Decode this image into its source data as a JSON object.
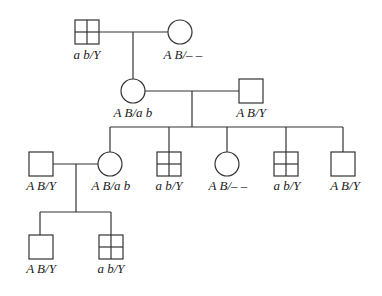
{
  "generations": {
    "I": {
      "father": {
        "sex": "male",
        "affected": true,
        "genotype": "a b/Y"
      },
      "mother": {
        "sex": "female",
        "affected": false,
        "genotype": "A B/– –"
      }
    },
    "II": {
      "daughter": {
        "sex": "female",
        "affected": false,
        "genotype": "A B/a b"
      },
      "spouse": {
        "sex": "male",
        "affected": false,
        "genotype": "A B/Y"
      }
    },
    "III": [
      {
        "sex": "male",
        "affected": false,
        "genotype": "A B/Y",
        "role": "spouse"
      },
      {
        "sex": "female",
        "affected": false,
        "genotype": "A B/a b"
      },
      {
        "sex": "male",
        "affected": true,
        "genotype": "a b/Y"
      },
      {
        "sex": "female",
        "affected": false,
        "genotype": "A B/– –"
      },
      {
        "sex": "male",
        "affected": true,
        "genotype": "a b/Y"
      },
      {
        "sex": "male",
        "affected": false,
        "genotype": "A B/Y"
      }
    ],
    "IV": [
      {
        "sex": "male",
        "affected": false,
        "genotype": "A B/Y"
      },
      {
        "sex": "male",
        "affected": true,
        "genotype": "a b/Y"
      }
    ]
  },
  "legend": {
    "square": "male",
    "circle": "female",
    "grid-square": "affected male"
  }
}
